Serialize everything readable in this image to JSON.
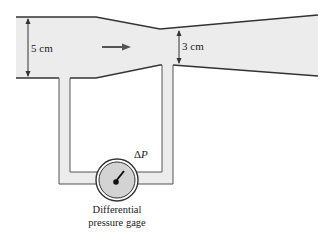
{
  "diagram": {
    "inlet_diameter_label": "5 cm",
    "throat_diameter_label": "3 cm",
    "pressure_label_delta": "Δ",
    "pressure_label_var": "P",
    "gage_label_line1": "Differential",
    "gage_label_line2": "pressure gage",
    "flow_direction": "right",
    "colors": {
      "fluid_fill": "#ececec",
      "outline": "#333333",
      "gage_face": "#d3d3d3"
    }
  }
}
